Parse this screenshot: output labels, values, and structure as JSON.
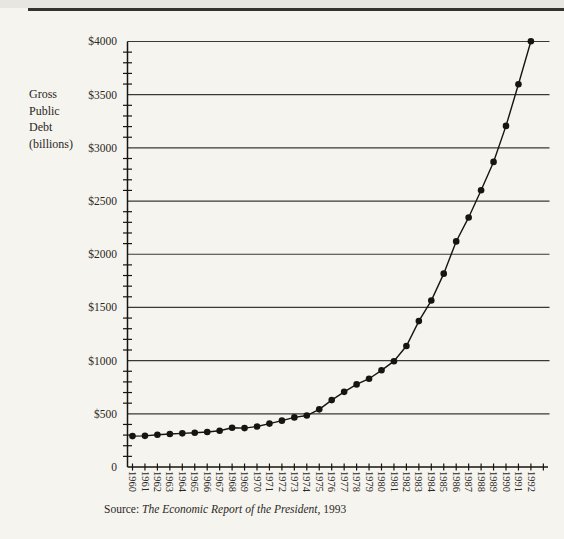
{
  "header": {
    "rule_color": "#35332e"
  },
  "chart": {
    "y_axis_title": [
      "Gross",
      "Public",
      "Debt",
      "(billions)"
    ],
    "source_prefix": "Source: ",
    "source_italic": "The Economic Report of the President,",
    "source_suffix": " 1993"
  },
  "chart_data": {
    "type": "line",
    "title": "",
    "xlabel": "",
    "ylabel": "Gross Public Debt (billions)",
    "categories": [
      "1960",
      "1961",
      "1962",
      "1963",
      "1964",
      "1965",
      "1966",
      "1967",
      "1968",
      "1969",
      "1970",
      "1971",
      "1972",
      "1973",
      "1974",
      "1975",
      "1976",
      "1977",
      "1978",
      "1979",
      "1980",
      "1981",
      "1982",
      "1983",
      "1984",
      "1985",
      "1986",
      "1987",
      "1988",
      "1989",
      "1990",
      "1991",
      "1992"
    ],
    "values": [
      290.5,
      292.6,
      302.9,
      310.3,
      316.1,
      322.3,
      328.5,
      340.4,
      368.7,
      365.8,
      380.9,
      408.2,
      435.9,
      466.3,
      483.9,
      541.9,
      629.0,
      706.4,
      776.6,
      829.5,
      909.0,
      994.8,
      1137.3,
      1371.7,
      1564.7,
      1817.5,
      2120.6,
      2346.1,
      2601.3,
      2868.0,
      3206.6,
      3598.5,
      4002.1
    ],
    "ylim": [
      0,
      4000
    ],
    "y_tick_interval": 500,
    "y_minor_tick_interval": 100,
    "y_tick_labels": [
      "0",
      "$500",
      "$1000",
      "$1500",
      "$2000",
      "$2500",
      "$3000",
      "$3500",
      "$4000"
    ],
    "x_tick_labels_rotated": true,
    "x_axis_extra_end_tick": true,
    "grid": "horizontal",
    "legend": "none",
    "marker": "filled-circle",
    "line_color": "#17150f",
    "grid_color": "#3a3831",
    "source": "Source: The Economic Report of the President, 1993"
  }
}
